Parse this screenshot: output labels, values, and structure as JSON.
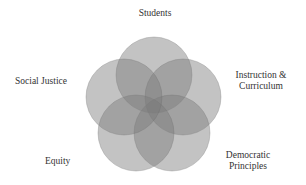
{
  "diagram": {
    "type": "five-set venn",
    "fill_color": "#7a7a7a",
    "fill_opacity": 0.45,
    "stroke_color": "#6a6a6a",
    "circles": [
      {
        "name": "Students",
        "cx": 154,
        "cy": 75,
        "r": 38
      },
      {
        "name": "Instruction & Curriculum",
        "cx": 183,
        "cy": 97,
        "r": 38
      },
      {
        "name": "Democratic Principles",
        "cx": 172,
        "cy": 133,
        "r": 38
      },
      {
        "name": "Equity",
        "cx": 136,
        "cy": 133,
        "r": 38
      },
      {
        "name": "Social Justice",
        "cx": 124,
        "cy": 97,
        "r": 38
      }
    ],
    "labels": {
      "students": "Students",
      "instruction_line1": "Instruction &",
      "instruction_line2": "Curriculum",
      "democratic_line1": "Democratic",
      "democratic_line2": "Principles",
      "equity": "Equity",
      "social_justice": "Social Justice"
    }
  }
}
